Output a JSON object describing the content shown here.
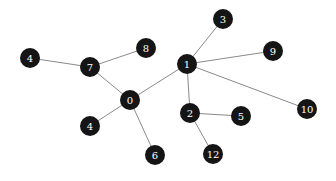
{
  "graph": {
    "node_radius": 10,
    "node_fill": "#151515",
    "label_color": "#ffffff",
    "edge_color": "#8a8a8a",
    "nodes": [
      {
        "id": "n4a",
        "label": "4",
        "x": 30,
        "y": 58
      },
      {
        "id": "n7",
        "label": "7",
        "x": 90,
        "y": 67
      },
      {
        "id": "n8",
        "label": "8",
        "x": 146,
        "y": 48
      },
      {
        "id": "n3",
        "label": "3",
        "x": 223,
        "y": 19
      },
      {
        "id": "n9",
        "label": "9",
        "x": 273,
        "y": 51
      },
      {
        "id": "n1",
        "label": "1",
        "x": 187,
        "y": 64
      },
      {
        "id": "n0",
        "label": "0",
        "x": 130,
        "y": 100
      },
      {
        "id": "n4b",
        "label": "4",
        "x": 90,
        "y": 126
      },
      {
        "id": "n6",
        "label": "6",
        "x": 155,
        "y": 155
      },
      {
        "id": "n2",
        "label": "2",
        "x": 190,
        "y": 113
      },
      {
        "id": "n5",
        "label": "5",
        "x": 241,
        "y": 116
      },
      {
        "id": "n12",
        "label": "12",
        "x": 213,
        "y": 154
      },
      {
        "id": "n10",
        "label": "10",
        "x": 307,
        "y": 109
      }
    ],
    "edges": [
      [
        "n4a",
        "n7"
      ],
      [
        "n7",
        "n8"
      ],
      [
        "n7",
        "n0"
      ],
      [
        "n0",
        "n1"
      ],
      [
        "n0",
        "n4b"
      ],
      [
        "n0",
        "n6"
      ],
      [
        "n1",
        "n3"
      ],
      [
        "n1",
        "n9"
      ],
      [
        "n1",
        "n10"
      ],
      [
        "n1",
        "n2"
      ],
      [
        "n2",
        "n5"
      ],
      [
        "n2",
        "n12"
      ]
    ]
  }
}
